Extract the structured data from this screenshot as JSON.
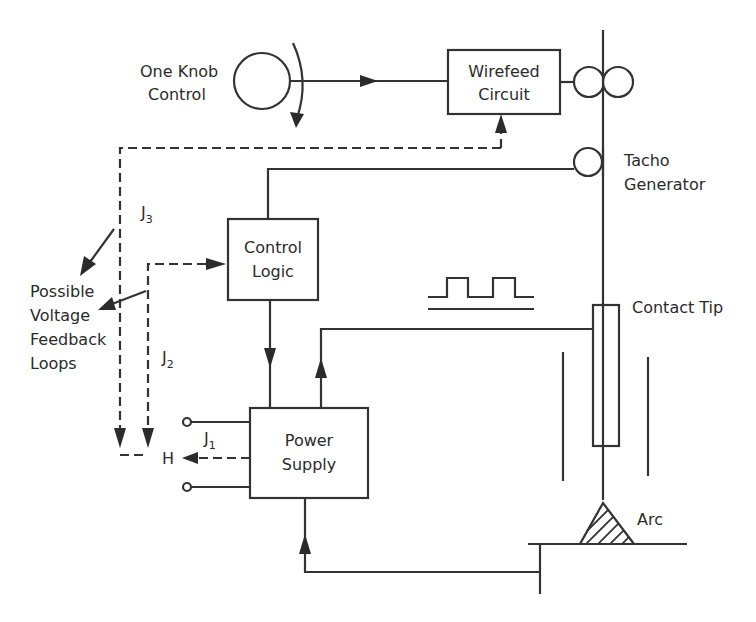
{
  "diagram": {
    "type": "block-diagram",
    "blocks": {
      "wirefeed": {
        "line1": "Wirefeed",
        "line2": "Circuit"
      },
      "control_logic": {
        "line1": "Control",
        "line2": "Logic"
      },
      "power_supply": {
        "line1": "Power",
        "line2": "Supply"
      }
    },
    "labels": {
      "knob_line1": "One Knob",
      "knob_line2": "Control",
      "tacho_line1": "Tacho",
      "tacho_line2": "Generator",
      "contact_tip": "Contact Tip",
      "arc": "Arc",
      "feedback_line1": "Possible",
      "feedback_line2": "Voltage",
      "feedback_line3": "Feedback",
      "feedback_line4": "Loops",
      "j3": "J",
      "j3_sub": "3",
      "j2": "J",
      "j2_sub": "2",
      "j1": "J",
      "j1_sub": "1",
      "h": "H"
    },
    "colors": {
      "line": "#333333",
      "background": "#ffffff"
    }
  }
}
